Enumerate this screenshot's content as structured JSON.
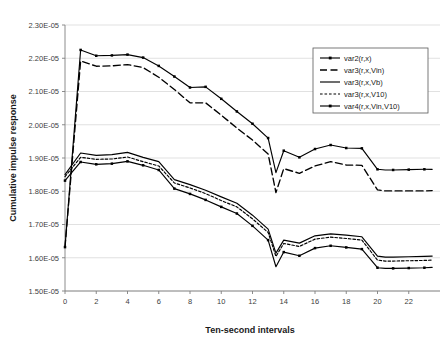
{
  "chart_data": {
    "type": "line",
    "title": "",
    "xlabel": "Ten-second intervals",
    "ylabel": "Cumulative impulse response",
    "xlim": [
      0,
      24
    ],
    "ylim": [
      1.5e-05,
      2.3e-05
    ],
    "grid": true,
    "legend_position": "upper-right",
    "x_ticks": [
      0,
      2,
      4,
      6,
      8,
      10,
      12,
      14,
      16,
      18,
      20,
      22
    ],
    "x_tick_labels": [
      "0",
      "2",
      "4",
      "6",
      "8",
      "10",
      "12",
      "14",
      "16",
      "18",
      "20",
      "22"
    ],
    "y_ticks": [
      1.5e-05,
      1.6e-05,
      1.7e-05,
      1.8e-05,
      1.9e-05,
      2e-05,
      2.1e-05,
      2.2e-05,
      2.3e-05
    ],
    "y_tick_labels": [
      "1.50E-05",
      "1.60E-05",
      "1.70E-05",
      "1.80E-05",
      "1.90E-05",
      "2.00E-05",
      "2.10E-05",
      "2.20E-05",
      "2.30E-05"
    ],
    "x": [
      0,
      1,
      2,
      3,
      4,
      5,
      6,
      7,
      8,
      9,
      10,
      11,
      12,
      13,
      13.5,
      14,
      15,
      16,
      17,
      18,
      19,
      20,
      20.5,
      21,
      22,
      23,
      23.5
    ],
    "series": [
      {
        "name": "var2(r,x)",
        "style": "solid-marker",
        "color": "#000000",
        "values": [
          1.632e-05,
          2.225e-05,
          2.2075e-05,
          2.2085e-05,
          2.211e-05,
          2.202e-05,
          2.177e-05,
          2.145e-05,
          2.112e-05,
          2.114e-05,
          2.078e-05,
          2.04e-05,
          2.003e-05,
          1.96e-05,
          1.856e-05,
          1.922e-05,
          1.902e-05,
          1.927e-05,
          1.939e-05,
          1.93e-05,
          1.929e-05,
          1.866e-05,
          1.864e-05,
          1.864e-05,
          1.865e-05,
          1.866e-05,
          1.866e-05
        ]
      },
      {
        "name": "var3(r,x,Vin)",
        "style": "long-dash",
        "color": "#000000",
        "values": [
          1.632e-05,
          2.192e-05,
          2.176e-05,
          2.177e-05,
          2.181e-05,
          2.172e-05,
          2.143e-05,
          2.106e-05,
          2.066e-05,
          2.066e-05,
          2.029e-05,
          1.99e-05,
          1.954e-05,
          1.912e-05,
          1.796e-05,
          1.868e-05,
          1.854e-05,
          1.876e-05,
          1.889e-05,
          1.879e-05,
          1.878e-05,
          1.804e-05,
          1.801e-05,
          1.801e-05,
          1.801e-05,
          1.801e-05,
          1.802e-05
        ]
      },
      {
        "name": "var3(r,x,Vb)",
        "style": "solid",
        "color": "#000000",
        "values": [
          1.85e-05,
          1.915e-05,
          1.908e-05,
          1.91e-05,
          1.917e-05,
          1.902e-05,
          1.889e-05,
          1.835e-05,
          1.82e-05,
          1.803e-05,
          1.783e-05,
          1.764e-05,
          1.728e-05,
          1.686e-05,
          1.614e-05,
          1.653e-05,
          1.644e-05,
          1.666e-05,
          1.672e-05,
          1.668e-05,
          1.663e-05,
          1.605e-05,
          1.602e-05,
          1.602e-05,
          1.603e-05,
          1.604e-05,
          1.605e-05
        ]
      },
      {
        "name": "var3(r,x,V10)",
        "style": "dotted",
        "color": "#000000",
        "values": [
          1.844e-05,
          1.902e-05,
          1.896e-05,
          1.897e-05,
          1.903e-05,
          1.889e-05,
          1.876e-05,
          1.825e-05,
          1.81e-05,
          1.793e-05,
          1.772e-05,
          1.753e-05,
          1.717e-05,
          1.676e-05,
          1.604e-05,
          1.643e-05,
          1.634e-05,
          1.656e-05,
          1.662e-05,
          1.658e-05,
          1.653e-05,
          1.593e-05,
          1.59e-05,
          1.59e-05,
          1.591e-05,
          1.592e-05,
          1.593e-05
        ]
      },
      {
        "name": "var4(r,x,Vin,V10)",
        "style": "solid-marker",
        "color": "#000000",
        "values": [
          1.832e-05,
          1.888e-05,
          1.881e-05,
          1.883e-05,
          1.89e-05,
          1.878e-05,
          1.864e-05,
          1.808e-05,
          1.792e-05,
          1.774e-05,
          1.753e-05,
          1.733e-05,
          1.696e-05,
          1.653e-05,
          1.573e-05,
          1.617e-05,
          1.606e-05,
          1.629e-05,
          1.636e-05,
          1.631e-05,
          1.626e-05,
          1.57e-05,
          1.568e-05,
          1.568e-05,
          1.569e-05,
          1.57e-05,
          1.571e-05
        ]
      }
    ]
  }
}
